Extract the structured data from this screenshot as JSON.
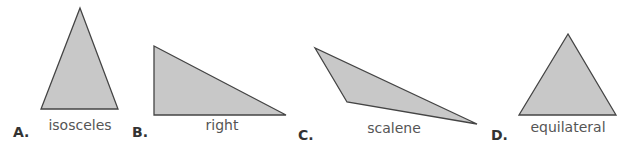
{
  "colors": {
    "fill": "#c8c8c8",
    "stroke": "#444444",
    "label": "#555555",
    "letter": "#333333"
  },
  "triangles": [
    {
      "letter": "A.",
      "name": "isosceles",
      "points": "80,8 41,109 118,109",
      "label_x": 80,
      "label_y": 117,
      "letter_x": 13,
      "letter_y": 124
    },
    {
      "letter": "B.",
      "name": "right",
      "points": "154,46 154,115 286,115",
      "label_x": 222,
      "label_y": 117,
      "letter_x": 132,
      "letter_y": 124
    },
    {
      "letter": "C.",
      "name": "scalene",
      "points": "315,48 347,102 477,124",
      "label_x": 394,
      "label_y": 120,
      "letter_x": 298,
      "letter_y": 127
    },
    {
      "letter": "D.",
      "name": "equilateral",
      "points": "568,34 519,115 616,115",
      "label_x": 568,
      "label_y": 119,
      "letter_x": 491,
      "letter_y": 127
    }
  ]
}
